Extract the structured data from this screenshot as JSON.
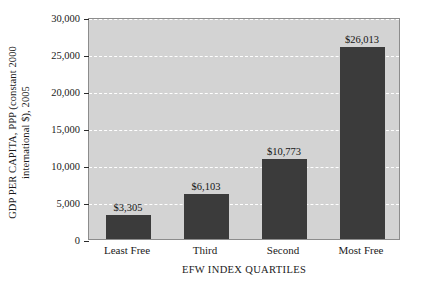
{
  "chart_data": {
    "type": "bar",
    "title": "",
    "categories": [
      "Least Free",
      "Third",
      "Second",
      "Most Free"
    ],
    "values": [
      3305,
      6103,
      10773,
      26013
    ],
    "data_labels": [
      "$3,305",
      "$6,103",
      "$10,773",
      "$26,013"
    ],
    "xlabel": "EFW INDEX QUARTILES",
    "ylabel_line1": "GDP PER CAPITA, PPP (constant 2000",
    "ylabel_line2": "international $), 2005",
    "ylim": [
      0,
      30000
    ],
    "ytick_values": [
      0,
      5000,
      10000,
      15000,
      20000,
      25000,
      30000
    ],
    "ytick_labels": [
      "0",
      "5,000",
      "10,000",
      "15,000",
      "20,000",
      "25,000",
      "30,000"
    ],
    "grid": true,
    "gridline_style": "dashed white horizontal",
    "legend": "none",
    "colors": {
      "bar": "#3b3b3b",
      "plot_background": "#d3d3d3",
      "figure_background": "#ffffff",
      "gridline": "#ffffff",
      "axis": "#8c8c8c",
      "text": "#1a1a1a"
    }
  }
}
